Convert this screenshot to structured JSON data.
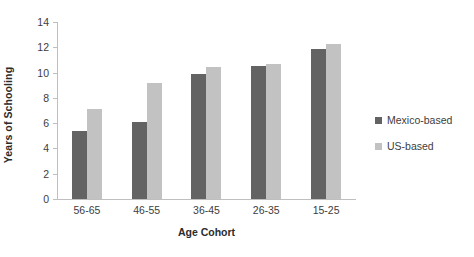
{
  "chart_data": {
    "type": "bar",
    "title": "",
    "xlabel": "Age Cohort",
    "ylabel": "Years of Schooling",
    "categories": [
      "56-65",
      "46-55",
      "36-45",
      "26-35",
      "15-25"
    ],
    "series": [
      {
        "name": "Mexico-based",
        "color": "#636363",
        "values": [
          5.4,
          6.1,
          9.85,
          10.5,
          11.9
        ]
      },
      {
        "name": "US-based",
        "color": "#c2c2c2",
        "values": [
          7.1,
          9.2,
          10.45,
          10.7,
          12.3
        ]
      }
    ],
    "ylim": [
      0,
      14
    ],
    "yticks": [
      0,
      2,
      4,
      6,
      8,
      10,
      12,
      14
    ],
    "ytick_labels": [
      "0",
      "2",
      "4",
      "6",
      "8",
      "10",
      "12",
      "14"
    ],
    "grid": false,
    "legend_position": "right"
  }
}
